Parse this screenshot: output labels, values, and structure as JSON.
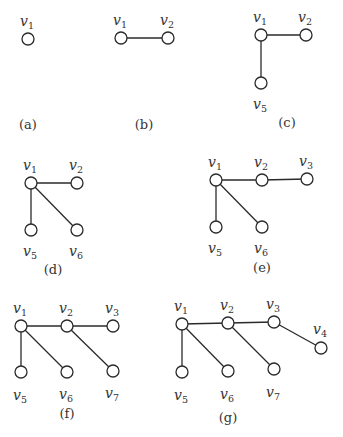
{
  "figure": {
    "node_radius": 6,
    "colors": {
      "stroke": "#2a2a2a",
      "text": "#333333",
      "background": "#ffffff",
      "node_fill": "#ffffff"
    }
  },
  "subfigures": [
    {
      "id": "a",
      "caption": "(a)",
      "caption_pos": [
        28,
        129
      ],
      "nodes": [
        {
          "id": "v1",
          "label": "v",
          "sub": "1",
          "x": 28,
          "y": 39,
          "lx": 20,
          "ly": 26
        }
      ],
      "edges": []
    },
    {
      "id": "b",
      "caption": "(b)",
      "caption_pos": [
        144,
        129
      ],
      "nodes": [
        {
          "id": "v1",
          "label": "v",
          "sub": "1",
          "x": 121,
          "y": 38,
          "lx": 113,
          "ly": 25
        },
        {
          "id": "v2",
          "label": "v",
          "sub": "2",
          "x": 168,
          "y": 38,
          "lx": 160,
          "ly": 25
        }
      ],
      "edges": [
        [
          "v1",
          "v2"
        ]
      ]
    },
    {
      "id": "c",
      "caption": "(c)",
      "caption_pos": [
        287,
        127
      ],
      "nodes": [
        {
          "id": "v1",
          "label": "v",
          "sub": "1",
          "x": 261,
          "y": 35,
          "lx": 253,
          "ly": 22
        },
        {
          "id": "v2",
          "label": "v",
          "sub": "2",
          "x": 306,
          "y": 35,
          "lx": 298,
          "ly": 22
        },
        {
          "id": "v5",
          "label": "v",
          "sub": "5",
          "x": 261,
          "y": 83,
          "lx": 253,
          "ly": 109
        }
      ],
      "edges": [
        [
          "v1",
          "v2"
        ],
        [
          "v1",
          "v5"
        ]
      ]
    },
    {
      "id": "d",
      "caption": "(d)",
      "caption_pos": [
        53,
        274
      ],
      "nodes": [
        {
          "id": "v1",
          "label": "v",
          "sub": "1",
          "x": 31,
          "y": 183,
          "lx": 23,
          "ly": 170
        },
        {
          "id": "v2",
          "label": "v",
          "sub": "2",
          "x": 77,
          "y": 183,
          "lx": 69,
          "ly": 170
        },
        {
          "id": "v5",
          "label": "v",
          "sub": "5",
          "x": 31,
          "y": 230,
          "lx": 23,
          "ly": 256
        },
        {
          "id": "v6",
          "label": "v",
          "sub": "6",
          "x": 77,
          "y": 230,
          "lx": 69,
          "ly": 256
        }
      ],
      "edges": [
        [
          "v1",
          "v2"
        ],
        [
          "v1",
          "v5"
        ],
        [
          "v1",
          "v6"
        ]
      ]
    },
    {
      "id": "e",
      "caption": "(e)",
      "caption_pos": [
        262,
        272
      ],
      "nodes": [
        {
          "id": "v1",
          "label": "v",
          "sub": "1",
          "x": 216,
          "y": 180,
          "lx": 208,
          "ly": 167
        },
        {
          "id": "v2",
          "label": "v",
          "sub": "2",
          "x": 262,
          "y": 180,
          "lx": 254,
          "ly": 167
        },
        {
          "id": "v3",
          "label": "v",
          "sub": "3",
          "x": 307,
          "y": 179,
          "lx": 299,
          "ly": 166
        },
        {
          "id": "v5",
          "label": "v",
          "sub": "5",
          "x": 216,
          "y": 227,
          "lx": 208,
          "ly": 253
        },
        {
          "id": "v6",
          "label": "v",
          "sub": "6",
          "x": 262,
          "y": 227,
          "lx": 254,
          "ly": 253
        }
      ],
      "edges": [
        [
          "v1",
          "v2"
        ],
        [
          "v2",
          "v3"
        ],
        [
          "v1",
          "v5"
        ],
        [
          "v1",
          "v6"
        ]
      ]
    },
    {
      "id": "f",
      "caption": "(f)",
      "caption_pos": [
        67,
        418
      ],
      "nodes": [
        {
          "id": "v1",
          "label": "v",
          "sub": "1",
          "x": 21,
          "y": 326,
          "lx": 13,
          "ly": 313
        },
        {
          "id": "v2",
          "label": "v",
          "sub": "2",
          "x": 67,
          "y": 326,
          "lx": 59,
          "ly": 313
        },
        {
          "id": "v3",
          "label": "v",
          "sub": "3",
          "x": 113,
          "y": 326,
          "lx": 105,
          "ly": 313
        },
        {
          "id": "v5",
          "label": "v",
          "sub": "5",
          "x": 21,
          "y": 372,
          "lx": 13,
          "ly": 400
        },
        {
          "id": "v6",
          "label": "v",
          "sub": "6",
          "x": 67,
          "y": 372,
          "lx": 59,
          "ly": 399
        },
        {
          "id": "v7",
          "label": "v",
          "sub": "7",
          "x": 113,
          "y": 371,
          "lx": 105,
          "ly": 398
        }
      ],
      "edges": [
        [
          "v1",
          "v2"
        ],
        [
          "v2",
          "v3"
        ],
        [
          "v1",
          "v5"
        ],
        [
          "v1",
          "v6"
        ],
        [
          "v2",
          "v7"
        ]
      ]
    },
    {
      "id": "g",
      "caption": "(g)",
      "caption_pos": [
        228,
        422
      ],
      "nodes": [
        {
          "id": "v1",
          "label": "v",
          "sub": "1",
          "x": 182,
          "y": 324,
          "lx": 174,
          "ly": 311
        },
        {
          "id": "v2",
          "label": "v",
          "sub": "2",
          "x": 228,
          "y": 323,
          "lx": 220,
          "ly": 310
        },
        {
          "id": "v3",
          "label": "v",
          "sub": "3",
          "x": 274,
          "y": 322,
          "lx": 266,
          "ly": 309
        },
        {
          "id": "v4",
          "label": "v",
          "sub": "4",
          "x": 321,
          "y": 348,
          "lx": 313,
          "ly": 334
        },
        {
          "id": "v5",
          "label": "v",
          "sub": "5",
          "x": 182,
          "y": 372,
          "lx": 174,
          "ly": 400
        },
        {
          "id": "v6",
          "label": "v",
          "sub": "6",
          "x": 228,
          "y": 371,
          "lx": 220,
          "ly": 399
        },
        {
          "id": "v7",
          "label": "v",
          "sub": "7",
          "x": 274,
          "y": 369,
          "lx": 266,
          "ly": 397
        }
      ],
      "edges": [
        [
          "v1",
          "v2"
        ],
        [
          "v2",
          "v3"
        ],
        [
          "v3",
          "v4"
        ],
        [
          "v1",
          "v5"
        ],
        [
          "v1",
          "v6"
        ],
        [
          "v2",
          "v7"
        ]
      ]
    }
  ]
}
